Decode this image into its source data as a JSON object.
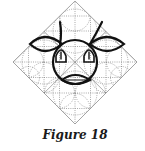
{
  "figure": {
    "caption": "Figure 18",
    "colors": {
      "ink": "#111111",
      "grid": "#9a9a9a",
      "dotted": "#6a6a6a",
      "background": "#ffffff"
    }
  }
}
